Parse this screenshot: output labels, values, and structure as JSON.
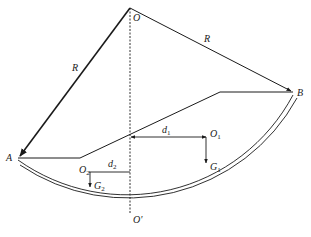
{
  "diagram": {
    "type": "mechanics-free-body-sector",
    "points": {
      "O": {
        "label": "O"
      },
      "O_prime": {
        "label": "O'"
      },
      "A": {
        "label": "A"
      },
      "B": {
        "label": "B"
      },
      "O1": {
        "label": "O",
        "sub": "1"
      },
      "O2": {
        "label": "O",
        "sub": "2"
      }
    },
    "radius_labels": {
      "left": "R",
      "right": "R"
    },
    "distances": {
      "d1": {
        "label": "d",
        "sub": "1"
      },
      "d2": {
        "label": "d",
        "sub": "2"
      }
    },
    "forces": {
      "G1": {
        "label": "G",
        "sub": "1"
      },
      "G2": {
        "label": "G",
        "sub": "2"
      }
    },
    "colors": {
      "line": "#1a1a1a",
      "background": "#ffffff"
    }
  }
}
